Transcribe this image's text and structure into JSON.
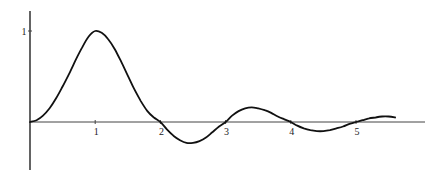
{
  "chart_data": {
    "type": "line",
    "title": "",
    "xlabel": "",
    "ylabel": "",
    "grid": false,
    "legend": null,
    "x_ticks": [
      "1",
      "2",
      "3",
      "4",
      "5"
    ],
    "y_ticks": [
      "1"
    ],
    "xlim": [
      0,
      6.0
    ],
    "ylim": [
      -0.55,
      1.2
    ],
    "series": [
      {
        "name": "curve",
        "x": [
          0,
          0.1,
          0.2,
          0.3,
          0.4,
          0.5,
          0.6,
          0.7,
          0.8,
          0.9,
          1.0,
          1.1,
          1.2,
          1.3,
          1.4,
          1.5,
          1.6,
          1.7,
          1.8,
          1.9,
          2.0,
          2.1,
          2.2,
          2.3,
          2.4,
          2.5,
          2.6,
          2.7,
          2.8,
          2.9,
          3.0,
          3.1,
          3.2,
          3.3,
          3.4,
          3.5,
          3.6,
          3.7,
          3.8,
          3.9,
          4.0,
          4.1,
          4.2,
          4.3,
          4.4,
          4.5,
          4.6,
          4.7,
          4.8,
          4.9,
          5.0,
          5.1,
          5.2,
          5.3,
          5.4,
          5.5,
          5.6
        ],
        "y": [
          0,
          0.02,
          0.07,
          0.15,
          0.26,
          0.39,
          0.53,
          0.68,
          0.82,
          0.94,
          1.0,
          0.98,
          0.91,
          0.8,
          0.66,
          0.51,
          0.36,
          0.23,
          0.12,
          0.05,
          0.0,
          -0.08,
          -0.15,
          -0.2,
          -0.23,
          -0.23,
          -0.21,
          -0.17,
          -0.11,
          -0.05,
          0.0,
          0.07,
          0.12,
          0.15,
          0.16,
          0.15,
          0.13,
          0.1,
          0.06,
          0.03,
          0.0,
          -0.04,
          -0.07,
          -0.09,
          -0.1,
          -0.1,
          -0.09,
          -0.07,
          -0.05,
          -0.02,
          0.0,
          0.02,
          0.04,
          0.05,
          0.06,
          0.06,
          0.05
        ]
      }
    ]
  }
}
